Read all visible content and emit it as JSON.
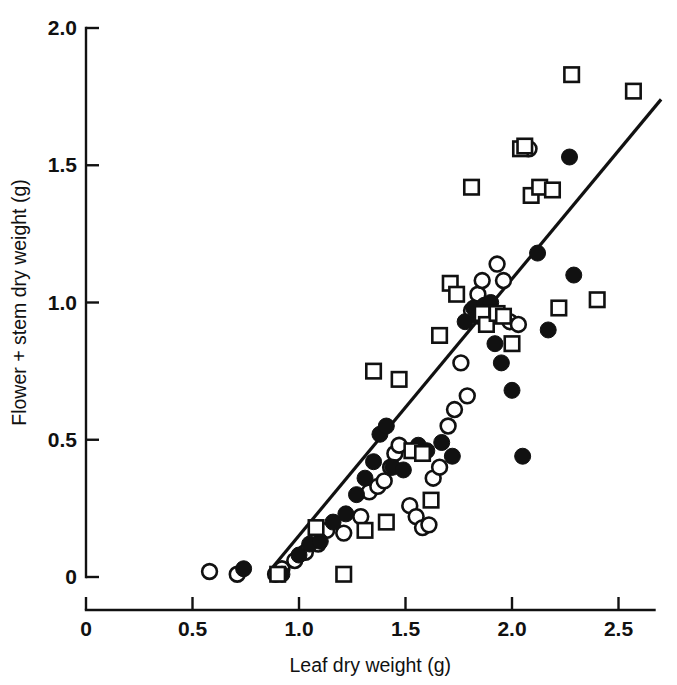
{
  "chart_data": {
    "type": "scatter",
    "title": "",
    "xlabel": "Leaf dry weight (g)",
    "ylabel": "Flower + stem dry weight (g)",
    "xlim": [
      0,
      2.73
    ],
    "ylim": [
      0,
      2.0
    ],
    "xticks": [
      0,
      0.5,
      1.0,
      1.5,
      2.0,
      2.5
    ],
    "xticklabels": [
      "0",
      "0.5",
      "1.0",
      "1.5",
      "2.0",
      "2.5"
    ],
    "yticks": [
      0,
      0.5,
      1.0,
      1.5,
      2.0
    ],
    "yticklabels": [
      "0",
      "0.5",
      "1.0",
      "1.5",
      "2.0"
    ],
    "grid": false,
    "legend": "none",
    "tick_direction": "in",
    "marker_types": [
      "open-circle",
      "filled-circle",
      "open-square"
    ],
    "series": [
      {
        "name": "open-circle",
        "marker": "open-circle",
        "color": "#ffffff",
        "edge_color": "#111111",
        "points": [
          [
            0.58,
            0.02
          ],
          [
            0.71,
            0.01
          ],
          [
            0.89,
            0.01
          ],
          [
            0.92,
            0.03
          ],
          [
            0.98,
            0.06
          ],
          [
            1.03,
            0.09
          ],
          [
            1.09,
            0.12
          ],
          [
            1.13,
            0.17
          ],
          [
            1.21,
            0.16
          ],
          [
            1.29,
            0.22
          ],
          [
            1.33,
            0.31
          ],
          [
            1.37,
            0.33
          ],
          [
            1.4,
            0.35
          ],
          [
            1.43,
            0.4
          ],
          [
            1.45,
            0.45
          ],
          [
            1.47,
            0.48
          ],
          [
            1.52,
            0.26
          ],
          [
            1.55,
            0.22
          ],
          [
            1.58,
            0.18
          ],
          [
            1.61,
            0.19
          ],
          [
            1.63,
            0.36
          ],
          [
            1.66,
            0.4
          ],
          [
            1.7,
            0.55
          ],
          [
            1.73,
            0.61
          ],
          [
            1.76,
            0.78
          ],
          [
            1.79,
            0.66
          ],
          [
            1.81,
            0.97
          ],
          [
            1.84,
            1.03
          ],
          [
            1.86,
            1.08
          ],
          [
            1.88,
            0.99
          ],
          [
            1.93,
            1.14
          ],
          [
            1.96,
            1.08
          ],
          [
            1.99,
            0.93
          ],
          [
            2.03,
            0.92
          ],
          [
            2.08,
            1.56
          ]
        ]
      },
      {
        "name": "filled-circle",
        "marker": "filled-circle",
        "color": "#111111",
        "edge_color": "#111111",
        "points": [
          [
            0.74,
            0.03
          ],
          [
            0.92,
            0.01
          ],
          [
            1.0,
            0.08
          ],
          [
            1.05,
            0.12
          ],
          [
            1.1,
            0.13
          ],
          [
            1.16,
            0.2
          ],
          [
            1.22,
            0.23
          ],
          [
            1.27,
            0.3
          ],
          [
            1.31,
            0.36
          ],
          [
            1.35,
            0.42
          ],
          [
            1.38,
            0.52
          ],
          [
            1.41,
            0.55
          ],
          [
            1.44,
            0.4
          ],
          [
            1.49,
            0.39
          ],
          [
            1.56,
            0.48
          ],
          [
            1.6,
            0.46
          ],
          [
            1.67,
            0.49
          ],
          [
            1.72,
            0.44
          ],
          [
            1.78,
            0.93
          ],
          [
            1.82,
            0.98
          ],
          [
            1.84,
            0.95
          ],
          [
            1.87,
            0.99
          ],
          [
            1.9,
            1.0
          ],
          [
            1.92,
            0.85
          ],
          [
            1.95,
            0.78
          ],
          [
            2.0,
            0.68
          ],
          [
            2.05,
            0.44
          ],
          [
            2.12,
            1.18
          ],
          [
            2.17,
            0.9
          ],
          [
            2.27,
            1.53
          ],
          [
            2.29,
            1.1
          ]
        ]
      },
      {
        "name": "open-square",
        "marker": "open-square",
        "color": "#ffffff",
        "edge_color": "#111111",
        "points": [
          [
            0.9,
            0.01
          ],
          [
            1.08,
            0.18
          ],
          [
            1.21,
            0.01
          ],
          [
            1.31,
            0.17
          ],
          [
            1.35,
            0.75
          ],
          [
            1.41,
            0.2
          ],
          [
            1.47,
            0.72
          ],
          [
            1.53,
            0.46
          ],
          [
            1.58,
            0.45
          ],
          [
            1.62,
            0.28
          ],
          [
            1.66,
            0.88
          ],
          [
            1.71,
            1.07
          ],
          [
            1.74,
            1.03
          ],
          [
            1.81,
            1.42
          ],
          [
            1.86,
            0.96
          ],
          [
            1.88,
            0.92
          ],
          [
            1.93,
            0.96
          ],
          [
            1.96,
            0.95
          ],
          [
            2.0,
            0.85
          ],
          [
            2.04,
            1.56
          ],
          [
            2.06,
            1.57
          ],
          [
            2.09,
            1.39
          ],
          [
            2.13,
            1.42
          ],
          [
            2.19,
            1.41
          ],
          [
            2.22,
            0.98
          ],
          [
            2.28,
            1.83
          ],
          [
            2.4,
            1.01
          ],
          [
            2.57,
            1.77
          ]
        ]
      }
    ],
    "fit_line": {
      "name": "regression-line",
      "x0": 0.86,
      "y0": 0.02,
      "x1": 2.7,
      "y1": 1.74,
      "style": "solid",
      "color": "#111111"
    }
  }
}
